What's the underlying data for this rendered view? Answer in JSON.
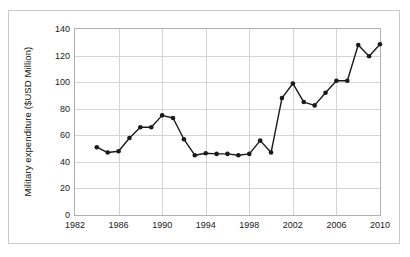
{
  "chart_data": {
    "type": "line",
    "title": "",
    "xlabel": "",
    "ylabel": "Military expenditure ($USD Million)",
    "xlim": [
      1982,
      2010
    ],
    "ylim": [
      0,
      140
    ],
    "ytick_step": 20,
    "xtick_step": 4,
    "grid": true,
    "legend": "none",
    "marker": "filled-circle",
    "line_color": "#1a1a1a",
    "grid_color": "#d4d4d4",
    "ytick_labels": [
      "0",
      "20",
      "40",
      "60",
      "80",
      "100",
      "120",
      "140"
    ],
    "ytick_values": [
      0,
      20,
      40,
      60,
      80,
      100,
      120,
      140
    ],
    "xtick_labels": [
      "1982",
      "1986",
      "1990",
      "1994",
      "1998",
      "2002",
      "2006",
      "2010"
    ],
    "xtick_values": [
      1982,
      1986,
      1990,
      1994,
      1998,
      2002,
      2006,
      2010
    ],
    "x": [
      1984,
      1985,
      1986,
      1987,
      1988,
      1989,
      1990,
      1991,
      1992,
      1993,
      1994,
      1995,
      1996,
      1997,
      1998,
      1999,
      2000,
      2001,
      2002,
      2003,
      2004,
      2005,
      2006,
      2007,
      2008,
      2009,
      2010
    ],
    "values": [
      51,
      47,
      48,
      58,
      66,
      66,
      75,
      73,
      57,
      45,
      46.5,
      46,
      46,
      45,
      46,
      56,
      47,
      88,
      99,
      85,
      82.5,
      92,
      101,
      101,
      128,
      119.5,
      128.5
    ],
    "series": [
      {
        "name": "Military expenditure",
        "values": [
          51,
          47,
          48,
          58,
          66,
          66,
          75,
          73,
          57,
          45,
          46.5,
          46,
          46,
          45,
          46,
          56,
          47,
          88,
          99,
          85,
          82.5,
          92,
          101,
          101,
          128,
          119.5,
          128.5
        ]
      }
    ]
  }
}
